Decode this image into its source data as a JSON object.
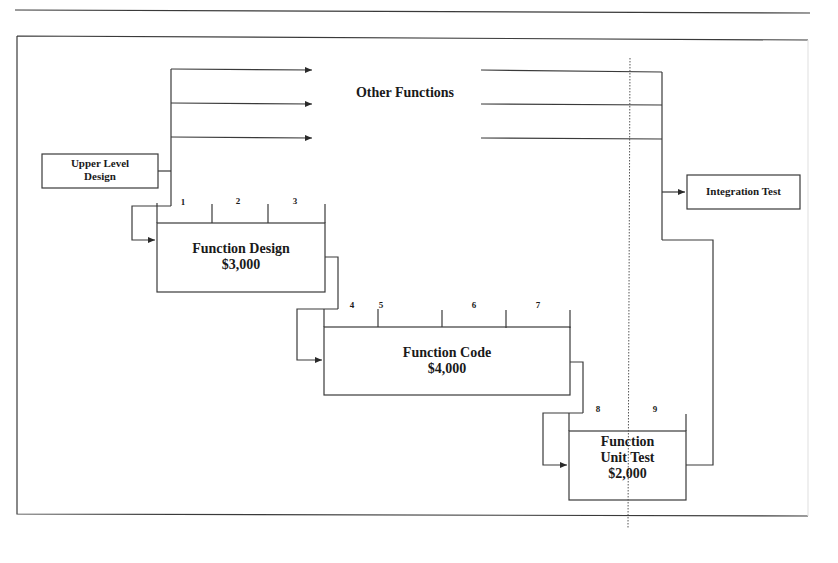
{
  "diagram": {
    "title": "",
    "nodes": {
      "upper_level_design": {
        "label_line1": "Upper Level",
        "label_line2": "Design"
      },
      "other_functions": {
        "label": "Other Functions"
      },
      "integration_test": {
        "label": "Integration Test"
      },
      "function_design": {
        "label": "Function Design",
        "cost": "$3,000",
        "periods": [
          "1",
          "2",
          "3"
        ]
      },
      "function_code": {
        "label": "Function Code",
        "cost": "$4,000",
        "periods": [
          "4",
          "5",
          "6",
          "7"
        ]
      },
      "function_unit_test": {
        "label_line1": "Function",
        "label_line2": "Unit Test",
        "cost": "$2,000",
        "periods": [
          "8",
          "9"
        ]
      }
    },
    "edges": [
      {
        "from": "Upper Level Design",
        "to": "Other Functions",
        "count": 3
      },
      {
        "from": "Upper Level Design",
        "to": "Function Design"
      },
      {
        "from": "Function Design",
        "to": "Function Code"
      },
      {
        "from": "Function Code",
        "to": "Function Unit Test"
      },
      {
        "from": "Other Functions",
        "to": "Integration Test"
      },
      {
        "from": "Function Unit Test",
        "to": "Integration Test"
      }
    ],
    "status_line": {
      "style": "dotted",
      "position": "between period 8 and 9"
    },
    "colors": {
      "line": "#3a3a3a",
      "text": "#1a1a1a",
      "background": "#ffffff"
    }
  }
}
